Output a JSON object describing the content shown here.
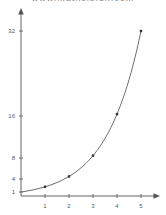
{
  "top_caption": "www.mathsisfun.com",
  "chart_data": {
    "type": "line",
    "title": "",
    "subtitle": "",
    "xlabel": "",
    "ylabel": "",
    "x": [
      1,
      2,
      3,
      4,
      5
    ],
    "values": [
      2,
      4,
      8,
      16,
      32
    ],
    "series": [
      {
        "name": "y = 2^x",
        "x": [
          1,
          2,
          3,
          4,
          5
        ],
        "values": [
          2,
          4,
          8,
          16,
          32
        ]
      }
    ],
    "curve_equation": "y = 2^x",
    "curve_domain": [
      0,
      5
    ],
    "xlim": [
      0,
      5.6
    ],
    "ylim": [
      0,
      36
    ],
    "xticks": [
      "1",
      "2",
      "3",
      "4",
      "5"
    ],
    "xtick_values": [
      1,
      2,
      3,
      4,
      5
    ],
    "yticks": [
      "1",
      "4",
      "8",
      "16",
      "32"
    ],
    "ytick_values": [
      1,
      4,
      8,
      16,
      32
    ],
    "grid": false,
    "legend": false,
    "legend_position": "none",
    "markers": true,
    "axis_arrows": true,
    "line_color": "#6d6d6d",
    "marker_color": "#333333",
    "axis_color": "#666666",
    "tick_text_color": "#5a5a5a",
    "background_color": "#ffffff"
  }
}
